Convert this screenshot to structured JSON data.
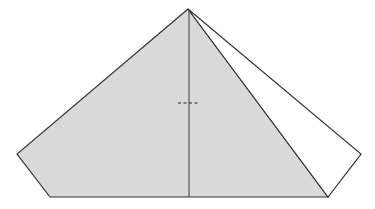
{
  "diagram": {
    "type": "pyramid-geometry",
    "colors": {
      "background": "#ffffff",
      "shaded_fill": "#d9d9d9",
      "outline": "#333333",
      "center_line": "#555555",
      "dash": "#222222"
    },
    "vertices": {
      "apex": [
        188,
        9
      ],
      "left": [
        17,
        154
      ],
      "bottom_left": [
        50,
        197
      ],
      "bottom_right": [
        328,
        197
      ],
      "right": [
        361,
        154
      ]
    },
    "shaded_face": "188,9 17,154 50,197 328,197",
    "white_face": "188,9 328,197 361,154",
    "center_line": {
      "x1": 189,
      "y1": 9,
      "x2": 189,
      "y2": 197
    },
    "dashed_segment": {
      "x1": 178,
      "y1": 103,
      "x2": 200,
      "y2": 103
    }
  }
}
